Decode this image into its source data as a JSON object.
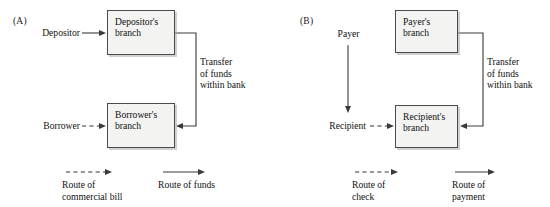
{
  "figure": {
    "type": "diagram",
    "panels": [
      {
        "id": "A",
        "label": "(A)",
        "nodes": [
          {
            "name": "depositor",
            "kind": "text",
            "label": "Depositor"
          },
          {
            "name": "depositors-branch",
            "kind": "box",
            "label": "Depositor's\nbranch"
          },
          {
            "name": "borrower",
            "kind": "text",
            "label": "Borrower"
          },
          {
            "name": "borrowers-branch",
            "kind": "box",
            "label": "Borrower's\nbranch"
          }
        ],
        "annotations": [
          {
            "name": "transfer-note",
            "label": "Transfer\nof funds\nwithin bank"
          }
        ],
        "edges": [
          {
            "from": "depositor",
            "to": "depositors-branch",
            "style": "solid",
            "meaning": "Route of funds"
          },
          {
            "from": "borrower",
            "to": "borrowers-branch",
            "style": "dashed",
            "meaning": "Route of commercial bill"
          },
          {
            "from": "depositors-branch",
            "to": "borrowers-branch",
            "style": "solid",
            "meaning": "Transfer of funds within bank"
          }
        ],
        "legend": [
          {
            "name": "legend-dashed",
            "style": "dashed",
            "label": "Route of\ncommercial bill"
          },
          {
            "name": "legend-solid",
            "style": "solid",
            "label": "Route of funds"
          }
        ]
      },
      {
        "id": "B",
        "label": "(B)",
        "nodes": [
          {
            "name": "payer",
            "kind": "text",
            "label": "Payer"
          },
          {
            "name": "payers-branch",
            "kind": "box",
            "label": "Payer's\nbranch"
          },
          {
            "name": "recipient",
            "kind": "text",
            "label": "Recipient"
          },
          {
            "name": "recipients-branch",
            "kind": "box",
            "label": "Recipient's\nbranch"
          }
        ],
        "annotations": [
          {
            "name": "transfer-note",
            "label": "Transfer\nof funds\nwithin bank"
          }
        ],
        "edges": [
          {
            "from": "payer",
            "to": "recipient",
            "style": "solid",
            "meaning": "Route of check"
          },
          {
            "from": "recipient",
            "to": "recipients-branch",
            "style": "dashed",
            "meaning": "Route of check"
          },
          {
            "from": "payers-branch",
            "to": "recipients-branch",
            "style": "solid",
            "meaning": "Transfer of funds within bank"
          }
        ],
        "legend": [
          {
            "name": "legend-dashed",
            "style": "dashed",
            "label": "Route of\ncheck"
          },
          {
            "name": "legend-solid",
            "style": "solid",
            "label": "Route of\npayment"
          }
        ]
      }
    ],
    "colors": {
      "box_fill": "#f3f3f1",
      "box_border": "#4a4a4a",
      "line": "#3a3a3a",
      "text": "#111111",
      "background": "#ffffff"
    }
  }
}
